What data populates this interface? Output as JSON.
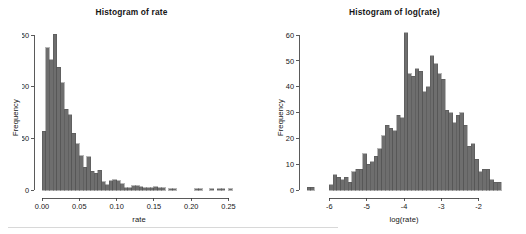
{
  "figure": {
    "width": 526,
    "height": 234,
    "background": "#ffffff",
    "bar_fill": "#6e6e6e",
    "bar_stroke": "#4a4a4a",
    "axis_color": "#3d3d3d",
    "text_color": "#161616"
  },
  "chart_data": [
    {
      "id": "histogram-rate",
      "type": "bar",
      "title": "Histogram of rate",
      "xlabel": "rate",
      "ylabel": "Frequency",
      "grid": false,
      "legend": "none",
      "xlim": [
        0.0,
        0.26
      ],
      "ylim": [
        0,
        155
      ],
      "xticks": [
        0.0,
        0.05,
        0.1,
        0.15,
        0.2,
        0.25
      ],
      "xticklabels": [
        "0.00",
        "0.05",
        "0.10",
        "0.15",
        "0.20",
        "0.25"
      ],
      "yticks": [
        0,
        50,
        100,
        150
      ],
      "yticklabels": [
        "0",
        "50",
        "100",
        "150"
      ],
      "bin_width": 0.005,
      "bin_starts": [
        0.0,
        0.005,
        0.01,
        0.015,
        0.02,
        0.025,
        0.03,
        0.035,
        0.04,
        0.045,
        0.05,
        0.055,
        0.06,
        0.065,
        0.07,
        0.075,
        0.08,
        0.085,
        0.09,
        0.095,
        0.1,
        0.105,
        0.11,
        0.115,
        0.12,
        0.125,
        0.13,
        0.135,
        0.14,
        0.145,
        0.15,
        0.155,
        0.16,
        0.165,
        0.17,
        0.175,
        0.18,
        0.185,
        0.19,
        0.195,
        0.2,
        0.205,
        0.21,
        0.215,
        0.22,
        0.225,
        0.23,
        0.235,
        0.24,
        0.245,
        0.25,
        0.255
      ],
      "values": [
        57,
        138,
        126,
        151,
        119,
        104,
        78,
        73,
        55,
        45,
        33,
        22,
        32,
        18,
        16,
        19,
        8,
        5,
        9,
        10,
        9,
        6,
        2,
        2,
        4,
        4,
        3,
        2,
        2,
        2,
        3,
        2,
        2,
        0,
        1,
        1,
        0,
        0,
        0,
        0,
        0,
        1,
        1,
        0,
        0,
        1,
        0,
        1,
        1,
        0,
        1,
        0
      ]
    },
    {
      "id": "histogram-log-rate",
      "type": "bar",
      "title": "Histogram of log(rate)",
      "xlabel": "log(rate)",
      "ylabel": "Frequency",
      "grid": false,
      "legend": "none",
      "xlim": [
        -6.6,
        -1.4
      ],
      "ylim": [
        0,
        62
      ],
      "xticks": [
        -6,
        -5,
        -4,
        -3,
        -2
      ],
      "xticklabels": [
        "-6",
        "-5",
        "-4",
        "-3",
        "-2"
      ],
      "yticks": [
        0,
        10,
        20,
        30,
        40,
        50,
        60
      ],
      "yticklabels": [
        "0",
        "10",
        "20",
        "30",
        "40",
        "50",
        "60"
      ],
      "bin_width": 0.1,
      "bin_starts": [
        -6.6,
        -6.5,
        -6.4,
        -6.3,
        -6.2,
        -6.1,
        -6.0,
        -5.9,
        -5.8,
        -5.7,
        -5.6,
        -5.5,
        -5.4,
        -5.3,
        -5.2,
        -5.1,
        -5.0,
        -4.9,
        -4.8,
        -4.7,
        -4.6,
        -4.5,
        -4.4,
        -4.3,
        -4.2,
        -4.1,
        -4.0,
        -3.9,
        -3.8,
        -3.7,
        -3.6,
        -3.5,
        -3.4,
        -3.3,
        -3.2,
        -3.1,
        -3.0,
        -2.9,
        -2.8,
        -2.7,
        -2.6,
        -2.5,
        -2.4,
        -2.3,
        -2.2,
        -2.1,
        -2.0,
        -1.9,
        -1.8,
        -1.7,
        -1.6,
        -1.5
      ],
      "values": [
        1,
        1,
        0,
        0,
        0,
        0,
        2,
        6,
        5,
        4,
        5,
        3,
        7,
        8,
        8,
        14,
        10,
        11,
        13,
        16,
        21,
        25,
        24,
        23,
        29,
        28,
        61,
        45,
        44,
        47,
        46,
        38,
        40,
        52,
        49,
        45,
        43,
        31,
        30,
        26,
        29,
        30,
        25,
        17,
        18,
        12,
        7,
        8,
        8,
        4,
        3,
        3
      ]
    }
  ]
}
